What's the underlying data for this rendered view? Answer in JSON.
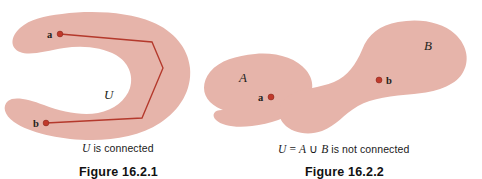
{
  "figure": {
    "domain_note": "Textbook mathematical illustration of connected vs disconnected open sets",
    "background_color": "#ffffff",
    "blob_fill_color": "#e6b4aa",
    "path_color": "#b4392c",
    "dot_color": "#c0392b",
    "text_color": "#231f20"
  },
  "left_panel": {
    "set_label": "U",
    "point_a_label": "a",
    "point_b_label": "b",
    "caption_prefix": "U",
    "caption_suffix": " is connected",
    "figure_number": "Figure 16.2.1"
  },
  "right_panel": {
    "set_a_label": "A",
    "set_b_label": "B",
    "point_a_label": "a",
    "point_b_label": "b",
    "caption_u": "U",
    "caption_equals": " = ",
    "caption_a": "A",
    "caption_union": " ∪ ",
    "caption_b": "B",
    "caption_suffix": " is not connected",
    "figure_number": "Figure 16.2.2"
  }
}
